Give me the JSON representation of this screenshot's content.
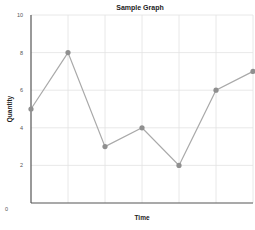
{
  "chart_data": {
    "type": "line",
    "title": "Sample Graph",
    "xlabel": "Time",
    "ylabel": "Quantity",
    "x": [
      0,
      1,
      2,
      3,
      4,
      5,
      6
    ],
    "series": [
      {
        "name": "Quantity",
        "values": [
          5,
          8,
          3,
          4,
          2,
          6,
          7
        ]
      }
    ],
    "ylim": [
      0,
      10
    ],
    "yticks": [
      0,
      2,
      4,
      6,
      8,
      10
    ],
    "xticks_labels_visible": false,
    "grid": true,
    "legend": "none",
    "colors": {
      "line": "#a9a9a9",
      "marker": "#8f8f8f",
      "grid": "#e2e2e2",
      "axis": "#555555"
    }
  }
}
